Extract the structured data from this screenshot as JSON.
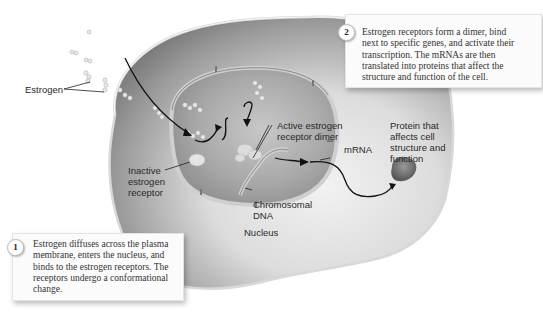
{
  "diagram": {
    "labels": {
      "estrogen": "Estrogen",
      "active_dimer": "Active estrogen receptor dimer",
      "active_dimer_line1": "Active estrogen",
      "active_dimer_line2": "receptor dimer",
      "mrna": "mRNA",
      "inactive_receptor_line1": "Inactive",
      "inactive_receptor_line2": "estrogen",
      "inactive_receptor_line3": "receptor",
      "chromosomal_dna_line1": "Chromosomal",
      "chromosomal_dna_line2": "DNA",
      "nucleus": "Nucleus",
      "protein_line1": "Protein that",
      "protein_line2": "affects cell",
      "protein_line3": "structure and",
      "protein_line4": "function"
    },
    "callouts": [
      {
        "number": "1",
        "lines": [
          "Estrogen diffuses across the plasma",
          "membrane, enters the nucleus, and",
          "binds to the estrogen receptors. The",
          "receptors undergo a conformational",
          "change."
        ]
      },
      {
        "number": "2",
        "lines": [
          "Estrogen receptors form a dimer, bind",
          "next to specific genes, and activate their",
          "transcription. The mRNAs are then",
          "translated into proteins that affect the",
          "structure and function of the cell."
        ]
      }
    ],
    "colors": {
      "cell_dark": "#7a7a7a",
      "cell_light": "#e6e6e6",
      "nucleus": "#9a9a9a",
      "arrow": "#111111",
      "callout_bg": "#fbfbfb"
    }
  }
}
